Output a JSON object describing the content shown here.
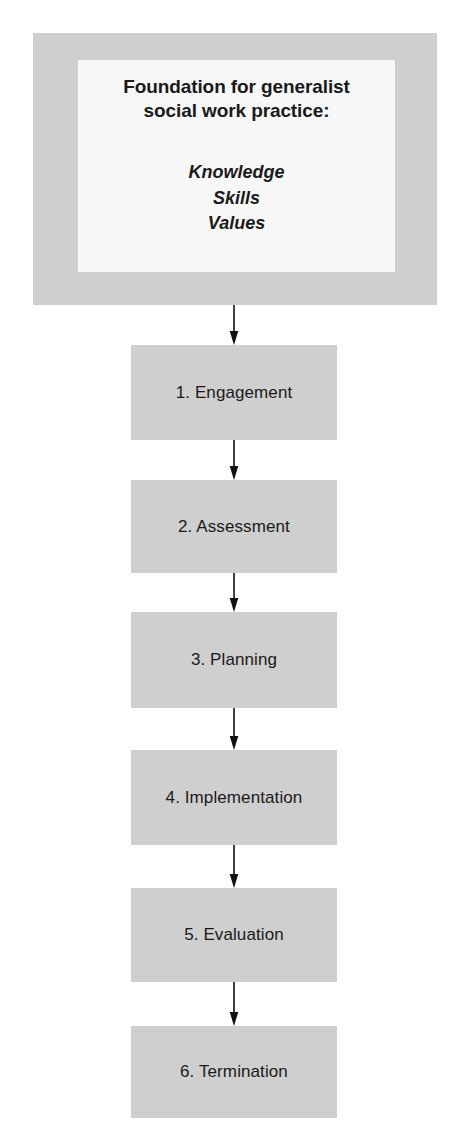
{
  "diagram": {
    "type": "flowchart",
    "orientation": "vertical",
    "colors": {
      "box_fill": "#cfcfcf",
      "inner_fill": "#f7f7f7",
      "text": "#1a1a1a",
      "arrow": "#111111",
      "background": "#ffffff"
    },
    "foundation": {
      "title_line1": "Foundation for generalist",
      "title_line2": "social work practice:",
      "items": [
        "Knowledge",
        "Skills",
        "Values"
      ]
    },
    "steps": [
      {
        "label": "1. Engagement"
      },
      {
        "label": "2. Assessment"
      },
      {
        "label": "3. Planning"
      },
      {
        "label": "4. Implementation"
      },
      {
        "label": "5. Evaluation"
      },
      {
        "label": "6. Termination"
      }
    ],
    "connectors": [
      {
        "name": "arrow-foundation-to-step-1"
      },
      {
        "name": "arrow-step-1-to-step-2"
      },
      {
        "name": "arrow-step-2-to-step-3"
      },
      {
        "name": "arrow-step-3-to-step-4"
      },
      {
        "name": "arrow-step-4-to-step-5"
      },
      {
        "name": "arrow-step-5-to-step-6"
      }
    ]
  }
}
